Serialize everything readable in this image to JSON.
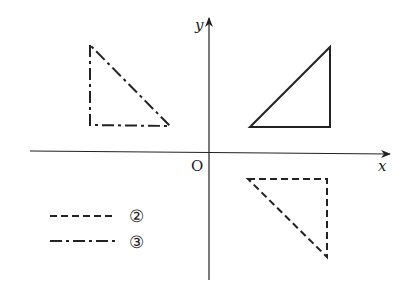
{
  "axes": {
    "x_label": "x",
    "y_label": "y",
    "origin_label": "O"
  },
  "figures": [
    {
      "name": "original",
      "style": "solid",
      "points": [
        [
          250,
          127
        ],
        [
          330,
          47
        ],
        [
          330,
          127
        ]
      ]
    },
    {
      "name": "reflection-y-axis",
      "style": "dash-dot",
      "points": [
        [
          90,
          45
        ],
        [
          90,
          125
        ],
        [
          170,
          126
        ]
      ]
    },
    {
      "name": "reflection-x-axis",
      "style": "dashed",
      "points": [
        [
          248,
          179
        ],
        [
          327,
          179
        ],
        [
          327,
          257
        ]
      ]
    }
  ],
  "legend": [
    {
      "style": "dashed",
      "label": "②"
    },
    {
      "style": "dash-dot",
      "label": "③"
    }
  ],
  "colors": {
    "line": "#222222",
    "background": "#ffffff"
  }
}
